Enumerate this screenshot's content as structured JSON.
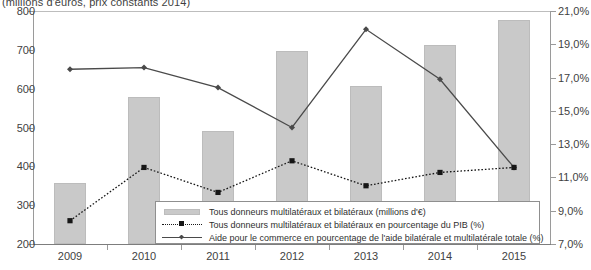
{
  "chart_data": {
    "type": "bar",
    "title": "(millions d'euros, prix constants 2014)",
    "xlabel": "",
    "ylabel": "",
    "categories": [
      "2009",
      "2010",
      "2011",
      "2012",
      "2013",
      "2014",
      "2015"
    ],
    "left_axis": {
      "ylim": [
        200,
        800
      ],
      "ticks": [
        "200",
        "300",
        "400",
        "500",
        "600",
        "700",
        "800"
      ],
      "tick_values": [
        200,
        300,
        400,
        500,
        600,
        700,
        800
      ]
    },
    "right_axis": {
      "ylim": [
        7.0,
        21.0
      ],
      "ticks": [
        "7,0%",
        "9,0%",
        "11,0%",
        "13,0%",
        "15,0%",
        "17,0%",
        "19,0%",
        "21,0%"
      ],
      "tick_values": [
        7.0,
        9.0,
        11.0,
        13.0,
        15.0,
        17.0,
        19.0,
        21.0
      ]
    },
    "grid": false,
    "legend_position": "inside-bottom-center",
    "series": [
      {
        "name": "Tous donneurs multilatéraux et bilatéraux (millions d'€)",
        "type": "bar",
        "axis": "left",
        "values": [
          358,
          578,
          492,
          698,
          608,
          712,
          778
        ],
        "color": "#c9c9c9"
      },
      {
        "name": "Tous donneurs multilatéraux et bilatéraux en pourcentage du PIB (%)",
        "type": "line",
        "style": "dotted",
        "marker": "square",
        "axis": "right",
        "values": [
          8.4,
          11.6,
          10.1,
          12.0,
          10.5,
          11.3,
          11.6
        ],
        "color": "#161616"
      },
      {
        "name": "Aide pour le commerce en pourcentage de l'aide bilatérale et multilatérale totale (%)",
        "type": "line",
        "style": "solid",
        "marker": "diamond",
        "axis": "right",
        "values": [
          17.5,
          17.6,
          16.4,
          14.0,
          19.9,
          16.9,
          11.6
        ],
        "color": "#4a4a4a"
      }
    ]
  },
  "legend": {
    "items": [
      {
        "label": "Tous donneurs multilatéraux et bilatéraux (millions d'€)",
        "key": "bar-swatch"
      },
      {
        "label": "Tous donneurs multilatéraux et bilatéraux en pourcentage du PIB (%)",
        "key": "dotted-line-swatch"
      },
      {
        "label": "Aide pour le commerce en pourcentage de l'aide bilatérale et multilatérale totale (%)",
        "key": "solid-line-swatch"
      }
    ]
  }
}
